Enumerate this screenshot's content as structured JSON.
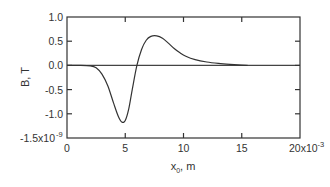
{
  "chart_data": {
    "type": "line",
    "title": "",
    "xlabel": "x",
    "xlabel_sub": "0",
    "xlabel_suffix": ", m",
    "ylabel": "B, T",
    "xlim": [
      0,
      0.02
    ],
    "ylim": [
      -1.5e-09,
      1e-09
    ],
    "x_ticks": [
      0,
      0.005,
      0.01,
      0.015,
      0.02
    ],
    "x_tick_labels": [
      "0",
      "5",
      "10",
      "15",
      "20x10"
    ],
    "x_tick_exponent": "-3",
    "y_ticks": [
      1.0,
      0.5,
      0.0,
      -0.5,
      -1.0,
      -1.5
    ],
    "y_tick_labels": [
      "1.0",
      "0.5",
      "0.0",
      "-0.5",
      "-1.0",
      "-1.5x10"
    ],
    "y_tick_exponent": "-9",
    "y_scale_note": "y values in units of 1e-9 T",
    "grid": false,
    "reference_line": {
      "y": 0
    },
    "series": [
      {
        "name": "B",
        "x": [
          0,
          1.0,
          2.0,
          2.5,
          3.0,
          3.5,
          4.0,
          4.4,
          4.7,
          5.0,
          5.3,
          5.6,
          6.0,
          6.4,
          6.8,
          7.2,
          7.7,
          8.2,
          8.7,
          9.2,
          9.7,
          10.2,
          11.0,
          12.0,
          13.0,
          14.0,
          15.0,
          15.5
        ],
        "x_units_scale": 0.001,
        "y": [
          0,
          0,
          -0.01,
          -0.05,
          -0.18,
          -0.42,
          -0.78,
          -1.05,
          -1.17,
          -1.14,
          -0.9,
          -0.5,
          0.0,
          0.33,
          0.52,
          0.6,
          0.61,
          0.56,
          0.46,
          0.35,
          0.26,
          0.19,
          0.12,
          0.07,
          0.04,
          0.02,
          0.005,
          0.0
        ]
      }
    ]
  }
}
